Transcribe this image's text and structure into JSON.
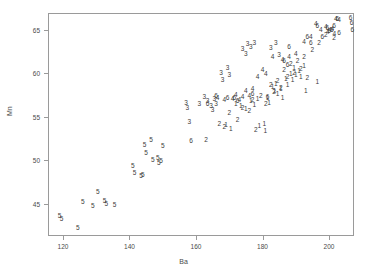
{
  "chart_data": {
    "type": "scatter",
    "title": "",
    "xlabel": "Ba",
    "ylabel": "Mn",
    "xlim": [
      115.5,
      207.5
    ],
    "ylim": [
      41.3,
      66.9
    ],
    "xticks": [
      120,
      140,
      160,
      180,
      200
    ],
    "yticks": [
      45,
      50,
      55,
      60,
      65
    ],
    "grid": false,
    "legend": false,
    "point_style": "group-number-glyph",
    "groups": [
      "1",
      "2",
      "3",
      "4",
      "5",
      "6"
    ],
    "series": [
      {
        "name": "1",
        "label": "1",
        "points": [
          [
            169.0,
            54.0
          ],
          [
            170.5,
            53.6
          ],
          [
            172.0,
            56.5
          ],
          [
            173.5,
            56.2
          ],
          [
            175.0,
            55.9
          ],
          [
            176.5,
            56.8
          ],
          [
            177.5,
            56.3
          ],
          [
            178.5,
            57.0
          ],
          [
            179.0,
            53.9
          ],
          [
            180.5,
            54.2
          ],
          [
            180.8,
            53.3
          ],
          [
            181.5,
            57.2
          ],
          [
            182.0,
            56.6
          ],
          [
            183.0,
            58.4
          ],
          [
            183.6,
            57.9
          ],
          [
            184.0,
            58.8
          ],
          [
            184.5,
            57.6
          ],
          [
            185.5,
            58.2
          ],
          [
            186.0,
            57.2
          ],
          [
            187.0,
            59.3
          ],
          [
            187.5,
            58.6
          ],
          [
            188.5,
            59.9
          ],
          [
            189.0,
            59.2
          ],
          [
            189.5,
            60.6
          ],
          [
            190.0,
            59.8
          ],
          [
            191.0,
            60.2
          ],
          [
            191.5,
            59.5
          ],
          [
            192.5,
            60.8
          ],
          [
            193.0,
            58.0
          ],
          [
            196.5,
            59.0
          ]
        ]
      },
      {
        "name": "2",
        "label": "2",
        "points": [
          [
            163.0,
            52.3
          ],
          [
            167.0,
            54.2
          ],
          [
            168.5,
            53.8
          ],
          [
            170.0,
            55.4
          ],
          [
            172.5,
            54.6
          ],
          [
            174.0,
            56.0
          ],
          [
            176.0,
            55.6
          ],
          [
            177.0,
            56.9
          ],
          [
            178.0,
            53.5
          ],
          [
            179.5,
            57.4
          ],
          [
            181.0,
            56.4
          ],
          [
            182.5,
            58.6
          ],
          [
            183.5,
            57.8
          ],
          [
            184.5,
            59.1
          ],
          [
            185.5,
            58.3
          ],
          [
            186.5,
            60.4
          ],
          [
            187.5,
            59.6
          ],
          [
            188.5,
            61.0
          ],
          [
            189.5,
            60.0
          ],
          [
            190.5,
            61.4
          ],
          [
            191.5,
            60.5
          ],
          [
            192.5,
            61.8
          ],
          [
            193.5,
            59.4
          ],
          [
            195.0,
            62.6
          ],
          [
            197.0,
            63.5
          ],
          [
            199.0,
            64.4
          ],
          [
            201.5,
            64.0
          ]
        ]
      },
      {
        "name": "3",
        "label": "3",
        "points": [
          [
            157.0,
            56.6
          ],
          [
            157.4,
            56.0
          ],
          [
            158.0,
            54.4
          ],
          [
            161.0,
            56.4
          ],
          [
            162.5,
            57.3
          ],
          [
            163.5,
            56.8
          ],
          [
            164.5,
            56.2
          ],
          [
            165.0,
            55.8
          ],
          [
            165.5,
            57.0
          ],
          [
            166.0,
            56.4
          ],
          [
            167.5,
            60.0
          ],
          [
            168.0,
            59.2
          ],
          [
            169.5,
            60.6
          ],
          [
            170.0,
            59.8
          ],
          [
            174.0,
            62.8
          ],
          [
            175.0,
            62.2
          ],
          [
            175.5,
            63.3
          ],
          [
            176.5,
            63.0
          ],
          [
            177.5,
            63.5
          ],
          [
            182.5,
            62.9
          ],
          [
            184.0,
            63.4
          ],
          [
            185.0,
            62.1
          ]
        ]
      },
      {
        "name": "4",
        "label": "4",
        "points": [
          [
            166.5,
            57.1
          ],
          [
            168.5,
            56.9
          ],
          [
            171.0,
            57.0
          ],
          [
            172.0,
            57.5
          ],
          [
            173.0,
            56.9
          ],
          [
            174.0,
            57.3
          ],
          [
            175.0,
            58.0
          ],
          [
            176.0,
            57.4
          ],
          [
            177.0,
            58.2
          ],
          [
            178.5,
            59.6
          ],
          [
            180.0,
            60.4
          ],
          [
            181.0,
            59.9
          ],
          [
            183.0,
            61.9
          ],
          [
            186.0,
            61.5
          ],
          [
            188.0,
            61.8
          ],
          [
            190.0,
            62.2
          ],
          [
            192.5,
            63.6
          ],
          [
            194.5,
            64.2
          ],
          [
            196.0,
            65.6
          ],
          [
            197.5,
            65.0
          ],
          [
            199.0,
            65.3
          ],
          [
            199.6,
            64.7
          ],
          [
            200.3,
            64.9
          ],
          [
            201.0,
            65.1
          ],
          [
            201.6,
            64.5
          ],
          [
            202.0,
            66.2
          ],
          [
            203.0,
            66.1
          ]
        ]
      },
      {
        "name": "5",
        "label": "5",
        "points": [
          [
            119.0,
            43.6
          ],
          [
            119.6,
            43.3
          ],
          [
            124.5,
            42.2
          ],
          [
            126.0,
            45.2
          ],
          [
            129.0,
            44.8
          ],
          [
            130.5,
            46.4
          ],
          [
            132.5,
            45.3
          ],
          [
            133.0,
            45.0
          ],
          [
            135.5,
            44.9
          ],
          [
            141.0,
            49.3
          ],
          [
            141.5,
            48.5
          ],
          [
            143.5,
            48.2
          ],
          [
            144.0,
            48.3
          ],
          [
            144.5,
            51.8
          ],
          [
            145.0,
            50.8
          ],
          [
            146.5,
            52.3
          ],
          [
            147.0,
            50.0
          ],
          [
            148.5,
            50.2
          ],
          [
            148.8,
            49.7
          ],
          [
            149.5,
            49.9
          ],
          [
            150.0,
            51.6
          ]
        ]
      },
      {
        "name": "6",
        "label": "6",
        "points": [
          [
            158.5,
            52.2
          ],
          [
            163.5,
            56.5
          ],
          [
            166.0,
            57.4
          ],
          [
            169.5,
            57.1
          ],
          [
            171.5,
            57.2
          ],
          [
            172.5,
            56.8
          ],
          [
            177.0,
            57.6
          ],
          [
            181.5,
            57.3
          ],
          [
            186.5,
            61.4
          ],
          [
            187.5,
            60.9
          ],
          [
            188.0,
            63.0
          ],
          [
            193.5,
            64.2
          ],
          [
            194.5,
            63.4
          ],
          [
            196.5,
            65.4
          ],
          [
            198.0,
            64.1
          ],
          [
            199.5,
            65.2
          ],
          [
            200.0,
            64.8
          ],
          [
            200.8,
            65.0
          ],
          [
            201.5,
            65.4
          ],
          [
            202.5,
            66.2
          ],
          [
            203.0,
            64.6
          ],
          [
            206.5,
            66.3
          ],
          [
            206.8,
            65.8
          ],
          [
            207.0,
            64.9
          ]
        ]
      }
    ]
  }
}
